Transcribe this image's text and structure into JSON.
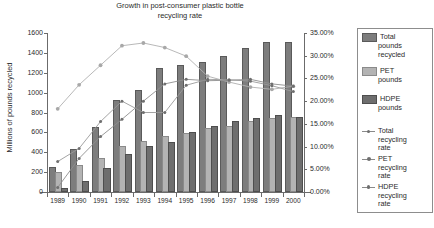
{
  "chart_data": {
    "type": "bar",
    "title": "Growth in post-consumer plastic bottle recycling rate",
    "title_line1": "Growth in post-consumer plastic bottle",
    "title_line2": "recycling rate",
    "xlabel": "",
    "ylabel": "Millions of pounds recycled",
    "ylabel_right": "Annual recycling rate",
    "categories": [
      "1989",
      "1990",
      "1991",
      "1992",
      "1993",
      "1994",
      "1995",
      "1996",
      "1997",
      "1998",
      "1999",
      "2000"
    ],
    "ylim": [
      0,
      1600
    ],
    "ylim_right": [
      0,
      0.35
    ],
    "ytick_labels": [
      "0",
      "200",
      "400",
      "600",
      "800",
      "1000",
      "1200",
      "1400",
      "1600"
    ],
    "ytick_values": [
      0,
      200,
      400,
      600,
      800,
      1000,
      1200,
      1400,
      1600
    ],
    "ytick_labels_right": [
      "0.00%",
      "5.00%",
      "10.00%",
      "15.00%",
      "20.00%",
      "25.00%",
      "30.00%",
      "35.00%"
    ],
    "ytick_values_right": [
      0,
      5,
      10,
      15,
      20,
      25,
      30,
      35
    ],
    "grid": false,
    "legend_position": "right",
    "series": [
      {
        "name": "Total pounds recycled",
        "kind": "bar",
        "axis": "left",
        "color": "#7d7d7d",
        "values": [
          230,
          415,
          635,
          910,
          1010,
          1230,
          1260,
          1290,
          1350,
          1430,
          1490,
          1490
        ]
      },
      {
        "name": "PET pounds",
        "kind": "bar",
        "axis": "left",
        "color": "#b3b3b3",
        "values": [
          180,
          250,
          325,
          440,
          490,
          540,
          570,
          620,
          645,
          690,
          725,
          735
        ]
      },
      {
        "name": "HDPE pounds",
        "kind": "bar",
        "axis": "left",
        "color": "#6e6e6e",
        "values": [
          25,
          90,
          225,
          360,
          445,
          480,
          580,
          645,
          695,
          720,
          750,
          735
        ]
      },
      {
        "name": "Total recycling rate",
        "kind": "line",
        "axis": "right",
        "color": "#9a9a9a",
        "values": [
          6.7,
          9.6,
          15.5,
          20.0,
          17.5,
          17.5,
          23.5,
          24.8,
          24.7,
          24.4,
          23.4,
          22.1
        ]
      },
      {
        "name": "PET recycling rate",
        "kind": "line",
        "axis": "right",
        "color": "#b0b0b0",
        "values": [
          18.3,
          23.6,
          27.9,
          32.2,
          32.8,
          31.8,
          29.9,
          25.5,
          24.2,
          23.1,
          22.6,
          23.3
        ]
      },
      {
        "name": "HDPE recycling rate",
        "kind": "line",
        "axis": "right",
        "color": "#8e8e8e",
        "values": [
          1.0,
          7.4,
          12.2,
          16.0,
          20.0,
          23.8,
          24.8,
          24.5,
          24.6,
          24.8,
          23.8,
          23.3
        ]
      }
    ],
    "legend_entries": [
      {
        "label_line1": "Total",
        "label_line2": "pounds",
        "label_line3": "recycled",
        "kind": "bar",
        "swatch": "s0"
      },
      {
        "label_line1": "PET",
        "label_line2": "pounds",
        "label_line3": "",
        "kind": "bar",
        "swatch": "s1"
      },
      {
        "label_line1": "HDPE",
        "label_line2": "pounds",
        "label_line3": "",
        "kind": "bar",
        "swatch": "s2"
      },
      {
        "label_line1": "Total",
        "label_line2": "recycling",
        "label_line3": "rate",
        "kind": "line",
        "swatch": "l0"
      },
      {
        "label_line1": "PET",
        "label_line2": "recycling",
        "label_line3": "rate",
        "kind": "line",
        "swatch": "l1"
      },
      {
        "label_line1": "HDPE",
        "label_line2": "recycling",
        "label_line3": "rate",
        "kind": "line",
        "swatch": "l2"
      }
    ]
  }
}
